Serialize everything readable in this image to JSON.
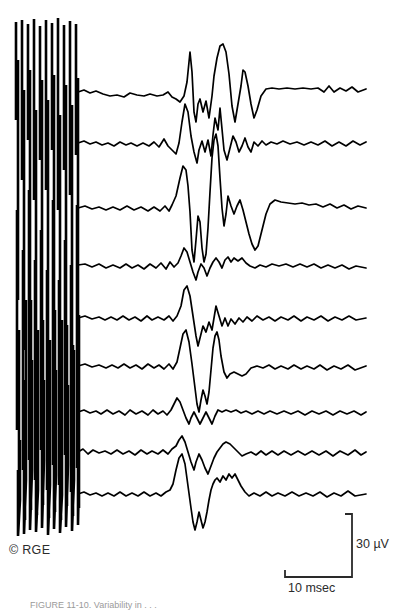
{
  "figure": {
    "credit": "© RGE",
    "caption_partial": "FIGURE 11-10.    Variability in . . .",
    "background_color": "#ffffff",
    "trace_color": "#000000",
    "label_color": "#2b2b2b"
  },
  "scale_bar": {
    "vertical_label": "30 µV",
    "horizontal_label": "10 msec",
    "vertical_value": 30,
    "vertical_unit": "µV",
    "horizontal_value": 10,
    "horizontal_unit": "msec",
    "corner_x": 352,
    "top_y": 514,
    "bottom_y": 577,
    "left_x": 285
  },
  "chart_data": {
    "type": "line",
    "title": "",
    "subtitle": "",
    "xlabel": "10 msec",
    "ylabel": "30 µV",
    "grid": false,
    "legend_position": "none",
    "n_traces": 9,
    "x_axis": {
      "unit": "msec",
      "pixels_per_unit": 9.2,
      "trace_start_px": 78,
      "trace_end_px": 366
    },
    "y_axis": {
      "unit": "µV",
      "pixels_per_unit": 2.1
    },
    "stimulus_artifact": {
      "x_start_px": 13,
      "x_end_px": 79,
      "y_top_px": 18,
      "y_bottom_px": 538,
      "description": "overlapping vertical stimulus artifact deflections"
    },
    "series": [
      {
        "name": "trace-1",
        "baseline_px": 92,
        "points": "78,92 84,90 90,93 96,91 103,94 110,96 117,95 124,97 130,93 137,95 144,96 150,94 157,96 163,95 168,92 172,97 176,99 180,102 184,96 187,82 190,52 192,72 194,112 196,122 198,104 200,99 203,112 206,101 209,118 212,96 214,76 217,58 220,46 223,44 226,52 229,74 232,106 235,122 238,104 241,86 243,70 245,72 248,86 251,104 254,118 257,110 261,96 266,89 272,88 279,89 287,88 295,89 303,88 311,89 318,88 324,92 329,86 334,92 340,88 346,91 352,87 358,92 366,89"
      },
      {
        "name": "trace-2",
        "baseline_px": 143,
        "points": "78,143 84,141 90,144 96,142 102,145 108,143 114,146 120,142 126,145 131,143 137,146 143,143 149,146 154,142 159,147 164,139 168,146 172,150 176,154 179,143 182,122 185,104 188,112 191,136 194,152 197,163 199,150 202,141 205,152 208,140 211,156 213,135 215,118 218,130 220,108 222,129 224,150 227,160 230,148 233,136 236,142 239,152 242,146 245,138 248,147 251,152 254,142 258,146 262,141 266,145 271,142 277,144 283,141 290,144 297,142 304,145 311,142 318,145 325,141 332,146 339,142 346,146 353,141 360,145 366,142"
      },
      {
        "name": "trace-3",
        "baseline_px": 208,
        "points": "78,208 85,206 92,209 99,207 106,210 113,207 120,210 127,206 134,210 141,207 148,211 154,207 160,211 165,206 169,211 172,205 176,196 180,178 183,166 186,170 188,186 190,212 192,250 194,262 196,240 198,216 200,222 202,248 204,262 206,254 208,228 210,192 212,158 214,140 216,134 218,146 220,178 222,208 224,226 226,214 228,196 231,206 234,214 237,206 240,200 243,210 246,222 249,234 252,244 255,250 258,246 262,230 266,214 270,204 275,200 281,202 288,203 295,204 302,203 309,205 316,204 323,207 330,204 337,208 344,205 351,209 358,206 366,208"
      },
      {
        "name": "trace-4",
        "baseline_px": 265,
        "points": "78,265 85,264 92,267 99,264 106,268 113,265 120,268 126,264 132,268 138,265 144,269 150,264 156,268 161,263 166,269 170,262 174,267 178,263 181,256 184,248 187,252 190,262 193,272 196,280 198,272 201,264 204,268 207,276 210,268 213,262 216,258 219,262 222,268 225,260 228,257 231,262 234,258 238,261 242,258 246,263 250,266 255,268 260,265 266,267 272,264 279,266 286,264 293,267 300,264 307,267 314,264 321,268 328,265 335,268 342,265 349,269 356,266 366,268"
      },
      {
        "name": "trace-5",
        "baseline_px": 318,
        "points": "78,318 85,316 92,319 99,317 105,320 111,317 117,320 123,316 129,320 135,317 141,321 147,316 152,320 158,317 164,320 169,316 173,321 177,316 181,306 184,290 187,286 190,296 193,316 196,336 198,346 200,338 203,326 206,332 209,322 212,330 214,318 216,306 219,316 222,326 225,318 228,326 231,319 235,324 239,318 243,322 247,317 252,321 257,316 263,320 269,317 275,321 281,317 288,320 294,316 301,321 307,317 314,320 321,316 328,321 335,317 342,320 349,316 356,320 366,318"
      },
      {
        "name": "trace-6",
        "baseline_px": 366,
        "points": "78,366 85,364 92,367 99,365 106,368 112,365 118,368 124,364 130,368 136,365 142,369 148,364 154,368 159,365 164,369 169,364 173,369 177,362 180,348 183,334 186,330 189,342 192,364 195,388 197,404 199,412 201,400 203,390 205,396 207,404 209,392 211,370 213,348 215,336 217,332 219,340 221,356 224,372 227,378 230,374 234,372 238,374 242,376 246,374 251,368 257,366 263,368 269,365 275,369 281,366 288,369 294,365 301,369 307,366 314,369 320,365 327,370 334,366 341,369 348,365 355,370 366,366"
      },
      {
        "name": "trace-7",
        "baseline_px": 412,
        "points": "78,412 84,410 90,413 96,411 101,414 107,410 113,414 119,411 125,415 130,410 136,414 142,411 148,415 153,410 158,414 163,411 167,415 171,410 174,404 177,398 180,402 183,410 186,418 189,424 191,418 194,412 197,418 200,424 203,418 206,412 209,418 212,424 215,416 218,410 222,412 226,410 231,412 236,410 241,413 246,411 252,414 258,411 264,414 270,411 277,414 284,411 291,414 298,411 305,415 312,411 319,414 326,411 333,415 340,411 347,414 354,411 361,415 366,412"
      },
      {
        "name": "trace-8",
        "baseline_px": 452,
        "points": "78,452 83,449 88,454 93,450 99,453 105,451 111,454 117,450 123,454 129,451 135,455 141,450 147,454 152,451 158,454 163,450 168,454 172,449 176,446 179,440 182,436 185,442 188,452 191,462 194,470 196,462 199,454 202,460 205,468 208,474 211,466 214,458 217,452 220,448 223,444 226,442 230,444 234,448 238,452 242,456 246,454 251,452 256,455 261,451 266,455 272,451 278,455 284,451 291,455 298,451 305,455 312,451 319,455 326,451 333,456 340,451 348,455 355,450 361,455 366,452"
      },
      {
        "name": "trace-9",
        "baseline_px": 494,
        "points": "78,494 84,492 90,495 96,493 102,496 108,493 114,496 120,492 126,496 132,493 138,496 144,492 150,496 156,493 161,496 166,492 170,490 173,484 176,470 179,458 182,454 185,464 188,486 191,508 193,522 195,530 197,522 199,512 201,520 203,528 205,522 207,512 209,500 211,490 213,484 215,480 217,478 220,482 223,476 226,480 229,474 232,478 235,474 238,480 241,486 245,492 249,496 254,493 260,496 266,492 272,496 278,493 285,496 292,492 299,496 306,493 313,496 320,492 327,497 334,493 341,496 348,491 355,496 366,494"
      }
    ],
    "artifact_strokes": [
      "16,22 16,120 18,60 18,300 17,210 17,430 19,330 19,508 18,470 18,536 20,500 20,440",
      "22,20 22,180 24,90 24,350 23,250 23,470 25,380 25,520 24,430 24,534 26,480 26,300",
      "28,24 28,140 30,70 30,320 29,190 29,460 31,300 31,510 30,440 30,530 32,470 32,360",
      "34,19 34,200 36,110 36,380 35,260 35,480 37,340 37,515 36,450 36,532 38,490 38,330",
      "40,26 40,160 42,80 42,340 41,230 41,450 43,320 43,505 42,420 42,528 44,460 44,380",
      "46,20 46,190 48,100 48,360 47,270 47,490 49,350 49,518 48,455 48,535 50,485 50,340",
      "52,23 52,150 54,75 54,330 53,200 53,465 55,310 55,512 54,435 54,529 56,475 56,370",
      "58,18 58,210 60,115 60,390 59,280 59,485 61,360 61,520 60,445 60,533 62,495 62,320",
      "64,25 64,170 66,85 66,345 65,240 65,455 67,325 67,506 66,425 66,527 68,465 68,385",
      "70,21 70,195 72,105 72,365 71,265 71,492 73,345 73,516 72,450 72,531 74,480 74,350",
      "76,24 76,155 78,78 78,335 77,205 77,468 79,315 79,508 78,438 78,525 79,470 79,375"
    ]
  }
}
